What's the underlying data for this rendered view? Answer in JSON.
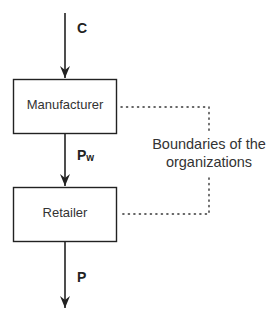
{
  "diagram": {
    "nodes": [
      {
        "id": "manufacturer",
        "label": "Manufacturer"
      },
      {
        "id": "retailer",
        "label": "Retailer"
      }
    ],
    "flows": [
      {
        "id": "input",
        "label": "C",
        "to": "manufacturer"
      },
      {
        "id": "wholesale",
        "label": "P",
        "subscript": "w",
        "from": "manufacturer",
        "to": "retailer"
      },
      {
        "id": "output",
        "label": "P",
        "from": "retailer"
      }
    ],
    "annotation": {
      "line1": "Boundaries of the",
      "line2": "organizations",
      "style": "dotted bracket linking both boxes"
    },
    "colors": {
      "stroke": "#222222",
      "text": "#333333",
      "background": "#ffffff"
    }
  }
}
